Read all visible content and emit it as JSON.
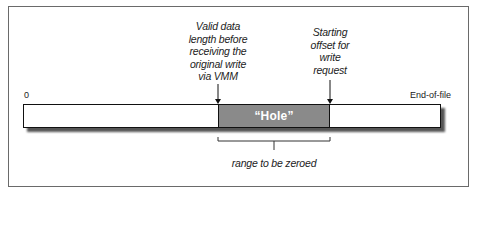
{
  "diagram": {
    "annotations": {
      "valid_data_length": [
        "Valid data",
        "length before",
        "receiving the",
        "original write",
        "via VMM"
      ],
      "starting_offset": [
        "Starting",
        "offset for",
        "write",
        "request"
      ]
    },
    "axis": {
      "start_label": "0",
      "end_label": "End-of-file"
    },
    "hole_label": "“Hole”",
    "bracket_label": "range to be zeroed",
    "colors": {
      "hole_fill": "#8a8a8a",
      "bar_fill": "#ffffff",
      "outline": "#111111"
    }
  }
}
